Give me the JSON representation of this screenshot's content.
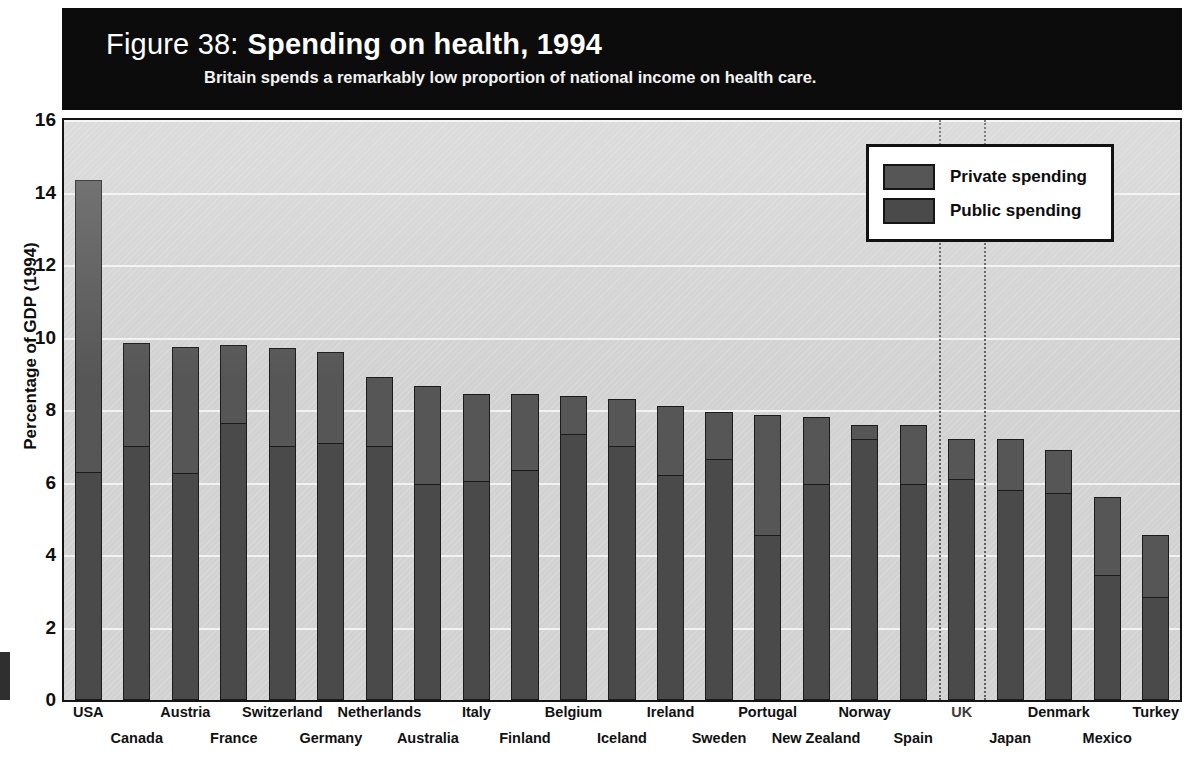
{
  "header": {
    "figure_label": "Figure 38:",
    "title": "Spending on health, 1994",
    "subtitle": "Britain spends a remarkably low proportion of national income on health care."
  },
  "legend": {
    "position": "top-right",
    "items": [
      {
        "label": "Private spending",
        "color": "#565656"
      },
      {
        "label": "Public spending",
        "color": "#4a4a4a"
      }
    ]
  },
  "axis": {
    "y_title": "Percentage of GDP (1994)",
    "y_ticks": [
      "0",
      "2",
      "4",
      "6",
      "8",
      "10",
      "12",
      "14",
      "16"
    ]
  },
  "highlight": {
    "country": "UK"
  },
  "chart_data": {
    "type": "bar",
    "stacked": true,
    "title": "Spending on health, 1994",
    "subtitle": "Britain spends a remarkably low proportion of national income on health care.",
    "xlabel": "",
    "ylabel": "Percentage of GDP (1994)",
    "ylim": [
      0,
      16
    ],
    "ytick_step": 2,
    "grid": true,
    "legend_position": "top-right",
    "categories": [
      "USA",
      "Canada",
      "Austria",
      "France",
      "Switzerland",
      "Germany",
      "Netherlands",
      "Australia",
      "Italy",
      "Finland",
      "Belgium",
      "Iceland",
      "Ireland",
      "Sweden",
      "Portugal",
      "New Zealand",
      "Norway",
      "Spain",
      "UK",
      "Japan",
      "Denmark",
      "Mexico",
      "Turkey"
    ],
    "series": [
      {
        "name": "Public spending",
        "color": "#4a4a4a",
        "values": [
          6.3,
          7.0,
          6.25,
          7.65,
          7.0,
          7.1,
          7.0,
          5.95,
          6.05,
          6.35,
          7.35,
          7.0,
          6.2,
          6.65,
          4.55,
          5.95,
          7.2,
          5.95,
          6.1,
          5.8,
          5.7,
          3.45,
          2.85
        ]
      },
      {
        "name": "Private spending",
        "color": "#565656",
        "values": [
          8.05,
          2.85,
          3.5,
          2.15,
          2.7,
          2.5,
          1.9,
          2.7,
          2.4,
          2.1,
          1.05,
          1.3,
          1.9,
          1.3,
          3.3,
          1.85,
          0.4,
          1.65,
          1.1,
          1.4,
          1.2,
          2.15,
          1.7
        ]
      }
    ],
    "totals": [
      14.35,
      9.85,
      9.75,
      9.8,
      9.7,
      9.6,
      8.9,
      8.65,
      8.45,
      8.45,
      8.4,
      8.3,
      8.1,
      7.95,
      7.85,
      7.8,
      7.6,
      7.6,
      7.2,
      7.2,
      6.9,
      5.6,
      4.55
    ],
    "annotations": [
      "UK highlighted with vertical dotted guide lines"
    ]
  }
}
